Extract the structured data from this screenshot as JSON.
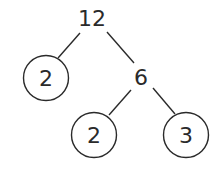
{
  "diagram": {
    "type": "factor-tree",
    "nodes": [
      {
        "id": "root",
        "label": "12",
        "circled": false,
        "x": 92,
        "y": 18
      },
      {
        "id": "left",
        "label": "2",
        "circled": true,
        "x": 46,
        "y": 78
      },
      {
        "id": "mid",
        "label": "6",
        "circled": false,
        "x": 141,
        "y": 77
      },
      {
        "id": "bl",
        "label": "2",
        "circled": true,
        "x": 94,
        "y": 135
      },
      {
        "id": "br",
        "label": "3",
        "circled": true,
        "x": 186,
        "y": 135
      }
    ],
    "edges": [
      {
        "from": "root",
        "to": "left"
      },
      {
        "from": "root",
        "to": "mid"
      },
      {
        "from": "mid",
        "to": "bl"
      },
      {
        "from": "mid",
        "to": "br"
      }
    ]
  }
}
